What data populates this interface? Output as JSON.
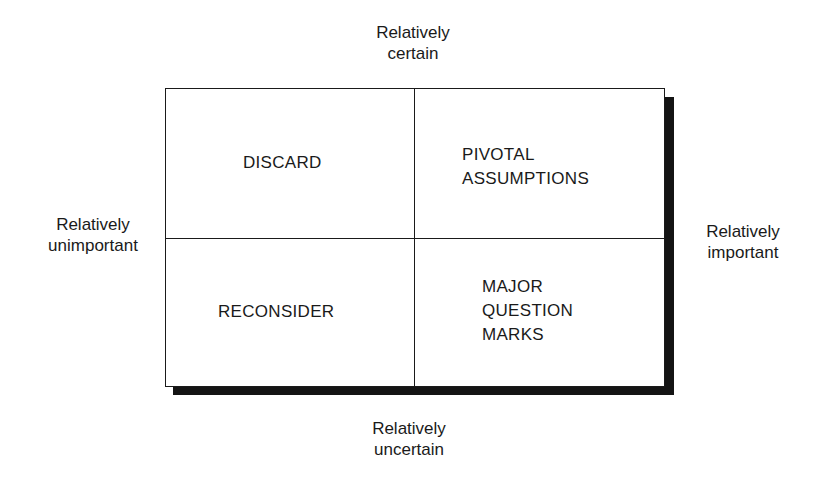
{
  "diagram": {
    "axes": {
      "top": [
        "Relatively",
        "certain"
      ],
      "bottom": [
        "Relatively",
        "uncertain"
      ],
      "left": [
        "Relatively",
        "unimportant"
      ],
      "right": [
        "Relatively",
        "important"
      ]
    },
    "quadrants": {
      "top_left": [
        "DISCARD"
      ],
      "top_right": [
        "PIVOTAL",
        "ASSUMPTIONS"
      ],
      "bottom_left": [
        "RECONSIDER"
      ],
      "bottom_right": [
        "MAJOR",
        "QUESTION",
        "MARKS"
      ]
    }
  }
}
